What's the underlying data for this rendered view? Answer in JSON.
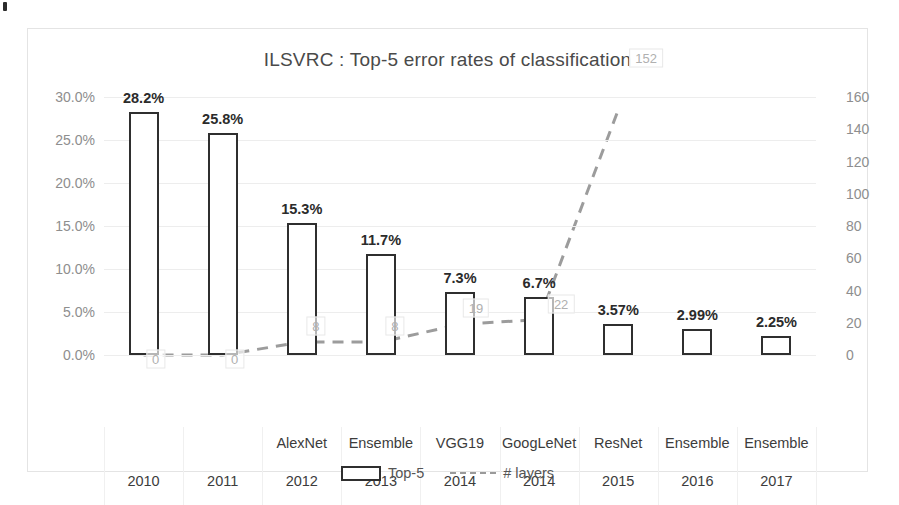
{
  "chart_data": {
    "type": "bar",
    "title": "ILSVRC : Top-5 error rates of classification",
    "xlabel": "",
    "ylabel": "",
    "y2label": "",
    "ylim": [
      0,
      30
    ],
    "y2lim": [
      0,
      160
    ],
    "grid": true,
    "legend_position": "bottom",
    "categories": [
      "2010",
      "2011",
      "2012",
      "2013",
      "2014",
      "2014",
      "2015",
      "2016",
      "2017"
    ],
    "models": [
      "",
      "",
      "AlexNet",
      "Ensemble",
      "VGG19",
      "GoogLeNet",
      "ResNet",
      "Ensemble",
      "Ensemble"
    ],
    "yticks": [
      "0.0%",
      "5.0%",
      "10.0%",
      "15.0%",
      "20.0%",
      "25.0%",
      "30.0%"
    ],
    "ytick_values": [
      0,
      5,
      10,
      15,
      20,
      25,
      30
    ],
    "y2ticks": [
      "0",
      "20",
      "40",
      "60",
      "80",
      "100",
      "120",
      "140",
      "160"
    ],
    "y2tick_values": [
      0,
      20,
      40,
      60,
      80,
      100,
      120,
      140,
      160
    ],
    "series": [
      {
        "name": "Top-5",
        "kind": "bar",
        "axis": "left",
        "values": [
          28.2,
          25.8,
          15.3,
          11.7,
          7.3,
          6.7,
          3.57,
          2.99,
          2.25
        ],
        "labels": [
          "28.2%",
          "25.8%",
          "15.3%",
          "11.7%",
          "7.3%",
          "6.7%",
          "3.57%",
          "2.99%",
          "2.25%"
        ]
      },
      {
        "name": "# layers",
        "kind": "line",
        "axis": "right",
        "values": [
          0,
          0,
          8,
          8,
          19,
          22,
          152,
          null,
          null
        ],
        "labels": [
          "0",
          "0",
          "8",
          "8",
          "19",
          "22",
          "152",
          "",
          ""
        ]
      }
    ]
  },
  "legend": {
    "bar_label": "Top-5",
    "line_label": "# layers"
  }
}
